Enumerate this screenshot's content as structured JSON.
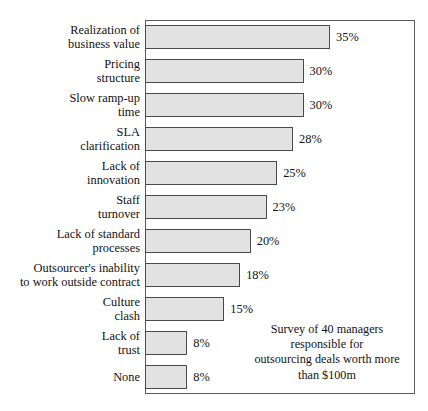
{
  "chart_data": {
    "type": "bar",
    "orientation": "horizontal",
    "title": "",
    "subtitle": "",
    "xlabel": "",
    "ylabel": "",
    "xlim": [
      0,
      35
    ],
    "grid": false,
    "legend": null,
    "value_suffix": "%",
    "categories": [
      "Realization of\nbusiness value",
      "Pricing\nstructure",
      "Slow ramp-up\ntime",
      "SLA\nclarification",
      "Lack of\ninnovation",
      "Staff\nturnover",
      "Lack of standard\nprocesses",
      "Outsourcer's inability\nto work outside contract",
      "Culture\nclash",
      "Lack of\ntrust",
      "None"
    ],
    "values": [
      35,
      30,
      30,
      28,
      25,
      23,
      20,
      18,
      15,
      8,
      8
    ],
    "value_labels": [
      "35%",
      "30%",
      "30%",
      "28%",
      "25%",
      "23%",
      "20%",
      "18%",
      "15%",
      "8%",
      "8%"
    ],
    "annotation": "Survey of 40 managers\nresponsible for\noutsourcing deals worth more\nthan $100m",
    "colors": {
      "bar_fill": "#e2e2e2",
      "bar_border": "#4a4a4a",
      "frame": "#5a5a5a",
      "text": "#121212",
      "background": "#ffffff"
    }
  }
}
